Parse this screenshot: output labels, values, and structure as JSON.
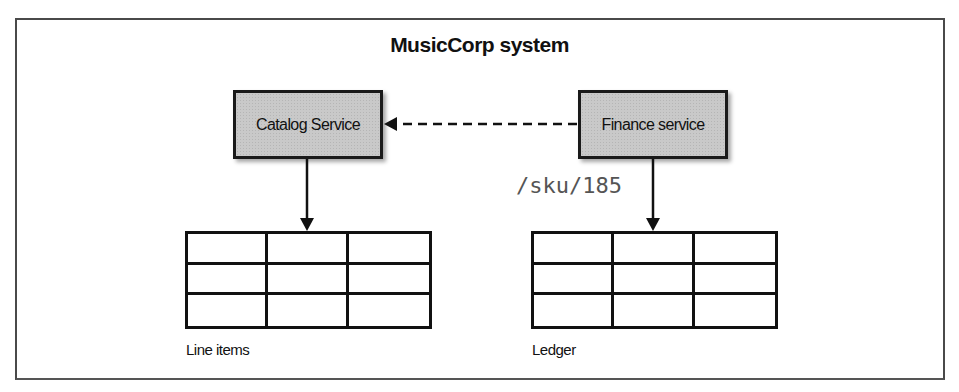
{
  "diagram": {
    "title": "MusicCorp system",
    "services": [
      {
        "id": "catalog",
        "label": "Catalog Service"
      },
      {
        "id": "finance",
        "label": "Finance service"
      }
    ],
    "tables": [
      {
        "id": "line-items",
        "label": "Line items",
        "rows": 3,
        "cols": 3
      },
      {
        "id": "ledger",
        "label": "Ledger",
        "rows": 3,
        "cols": 3
      }
    ],
    "edges": [
      {
        "from": "finance",
        "to": "catalog",
        "style": "dashed",
        "label": ""
      },
      {
        "from": "catalog",
        "to": "line-items",
        "style": "solid",
        "label": ""
      },
      {
        "from": "finance",
        "to": "ledger",
        "style": "solid",
        "label": "/sku/185"
      }
    ],
    "annotation": "/sku/185",
    "colors": {
      "service_fill": "#c9c9c9",
      "stroke": "#111111",
      "annotation": "#555555",
      "frame": "#4a4a4a"
    }
  }
}
